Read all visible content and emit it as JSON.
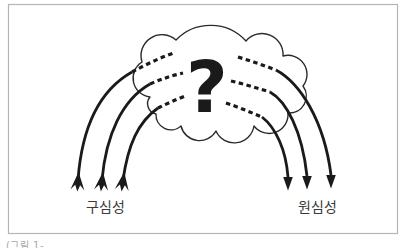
{
  "figure": {
    "frame": {
      "border_color": "#b4b4b4"
    },
    "cloud": {
      "question_mark": "?",
      "outline_color": "#2a2a2a",
      "fill_color": "#ffffff",
      "text_color": "#1a1a1a"
    },
    "arrows": {
      "color": "#1a1a1a",
      "left_group_count": 3,
      "right_group_count": 3
    },
    "labels": {
      "left_label": "구심성",
      "right_label": "원심성",
      "color": "#3a3a3a"
    },
    "caption_fragment": "(그림 1-"
  }
}
